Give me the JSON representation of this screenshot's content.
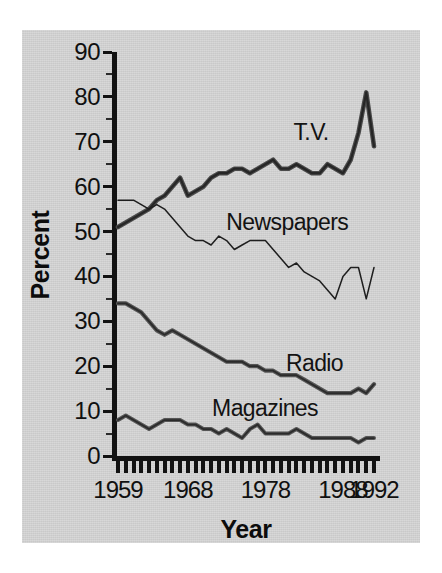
{
  "figure": {
    "background_color": "#d3d3d3",
    "ink_color": "#121212"
  },
  "axes": {
    "y_title": "Percent",
    "x_title": "Year",
    "y_ticks": [
      0,
      10,
      20,
      30,
      40,
      50,
      60,
      70,
      80,
      90
    ],
    "x_tick_labels": [
      "1959",
      "1968",
      "1978",
      "1988",
      "1992"
    ],
    "x_tick_label_years": [
      1959,
      1968,
      1978,
      1988,
      1992
    ]
  },
  "series_labels": {
    "tv": "T.V.",
    "newspapers": "Newspapers",
    "radio": "Radio",
    "magazines": "Magazines"
  },
  "chart_data": {
    "type": "line",
    "title": "",
    "subtitle": "",
    "xlabel": "Year",
    "ylabel": "Percent",
    "xlim": [
      1959,
      1992
    ],
    "ylim": [
      0,
      90
    ],
    "grid": false,
    "legend": "inline-labels",
    "x": [
      1959,
      1960,
      1961,
      1962,
      1963,
      1964,
      1965,
      1966,
      1967,
      1968,
      1969,
      1970,
      1971,
      1972,
      1973,
      1974,
      1975,
      1976,
      1977,
      1978,
      1979,
      1980,
      1981,
      1982,
      1983,
      1984,
      1985,
      1986,
      1987,
      1988,
      1989,
      1990,
      1991,
      1992
    ],
    "series": [
      {
        "name": "T.V.",
        "color": "#3a3a3a",
        "values": [
          51,
          52,
          53,
          54,
          55,
          57,
          58,
          60,
          62,
          58,
          59,
          60,
          62,
          63,
          63,
          64,
          64,
          63,
          64,
          65,
          66,
          64,
          64,
          65,
          64,
          63,
          63,
          65,
          64,
          63,
          66,
          72,
          81,
          69
        ]
      },
      {
        "name": "Newspapers",
        "color": "#1e1e1e",
        "values": [
          57,
          57,
          57,
          56,
          55,
          56,
          55,
          53,
          51,
          49,
          48,
          48,
          47,
          49,
          48,
          46,
          47,
          48,
          48,
          48,
          46,
          44,
          42,
          43,
          41,
          40,
          39,
          37,
          35,
          40,
          42,
          42,
          35,
          42
        ]
      },
      {
        "name": "Radio",
        "color": "#4a4a4a",
        "values": [
          34,
          34,
          33,
          32,
          30,
          28,
          27,
          28,
          27,
          26,
          25,
          24,
          23,
          22,
          21,
          21,
          21,
          20,
          20,
          19,
          19,
          18,
          18,
          18,
          17,
          16,
          15,
          14,
          14,
          14,
          14,
          15,
          14,
          16
        ]
      },
      {
        "name": "Magazines",
        "color": "#4a4a4a",
        "values": [
          8,
          9,
          8,
          7,
          6,
          7,
          8,
          8,
          8,
          7,
          7,
          6,
          6,
          5,
          6,
          5,
          4,
          6,
          7,
          5,
          5,
          5,
          5,
          6,
          5,
          4,
          4,
          4,
          4,
          4,
          4,
          3,
          4,
          4
        ]
      }
    ]
  }
}
